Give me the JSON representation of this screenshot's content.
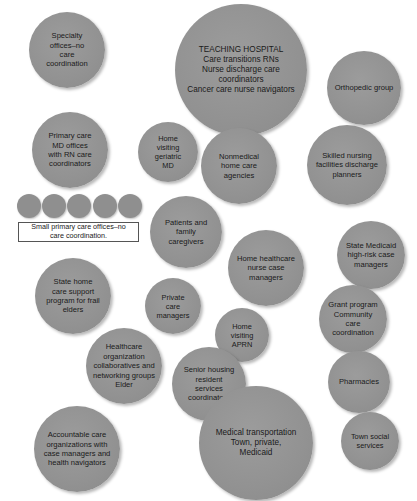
{
  "diagram": {
    "type": "bubble-map",
    "bubbles": [
      {
        "id": "specialty-offices",
        "label": "Specialty\noffices–no\ncare\ncoordination",
        "cx": 67,
        "cy": 50,
        "r": 38
      },
      {
        "id": "teaching-hospital",
        "label": "TEACHING HOSPITAL\nCare transitions RNs\nNurse discharge care\ncoordinators\nCancer care nurse navigators",
        "cx": 241,
        "cy": 70,
        "r": 66
      },
      {
        "id": "orthopedic-group",
        "label": "Orthopedic group",
        "cx": 364,
        "cy": 88,
        "r": 37
      },
      {
        "id": "primary-care-md",
        "label": "Primary care\nMD offices\nwith RN care\ncoordinators",
        "cx": 70,
        "cy": 150,
        "r": 38
      },
      {
        "id": "home-visiting-geriatric-md",
        "label": "Home\nvisiting\ngeriatric\nMD",
        "cx": 168,
        "cy": 152,
        "r": 30
      },
      {
        "id": "nonmedical-home-care",
        "label": "Nonmedical\nhome care\nagencies",
        "cx": 239,
        "cy": 166,
        "r": 38
      },
      {
        "id": "skilled-nursing",
        "label": "Skilled nursing\nfacilities discharge\nplanners",
        "cx": 347,
        "cy": 165,
        "r": 40
      },
      {
        "id": "patients-caregivers",
        "label": "Patients and\nfamily\ncaregivers",
        "cx": 186,
        "cy": 232,
        "r": 36
      },
      {
        "id": "state-medicaid",
        "label": "State Medicaid\nhigh-risk case\nmanagers",
        "cx": 371,
        "cy": 255,
        "r": 34
      },
      {
        "id": "home-healthcare-nurse",
        "label": "Home healthcare\nnurse case\nmanagers",
        "cx": 266,
        "cy": 268,
        "r": 38
      },
      {
        "id": "state-home-care",
        "label": "State home\ncare support\nprogram for frail\nelders",
        "cx": 73,
        "cy": 296,
        "r": 38
      },
      {
        "id": "private-care-managers",
        "label": "Private\ncare\nmanagers",
        "cx": 173,
        "cy": 306,
        "r": 28
      },
      {
        "id": "grant-program",
        "label": "Grant program\nCommunity\ncare\ncoordination",
        "cx": 353,
        "cy": 319,
        "r": 34
      },
      {
        "id": "home-visiting-aprn",
        "label": "Home\nvisiting\nAPRN",
        "cx": 242,
        "cy": 335,
        "r": 27
      },
      {
        "id": "healthcare-org-collaboratives",
        "label": "Healthcare\norganization\ncollaboratives and\nnetworking groups\nElder",
        "cx": 124,
        "cy": 366,
        "r": 38
      },
      {
        "id": "senior-housing",
        "label": "Senior housing\nresident\nservices\ncoordinators",
        "cx": 209,
        "cy": 384,
        "r": 37
      },
      {
        "id": "pharmacies",
        "label": "Pharmacies",
        "cx": 359,
        "cy": 382,
        "r": 31
      },
      {
        "id": "accountable-care",
        "label": "Accountable care\norganizations with\ncase managers and\nhealth navigators",
        "cx": 77,
        "cy": 449,
        "r": 43
      },
      {
        "id": "medical-transportation",
        "label": "Medical transportation\nTown, private,\nMedicaid",
        "cx": 256,
        "cy": 443,
        "r": 57
      },
      {
        "id": "town-social-services",
        "label": "Town social\nservices",
        "cx": 370,
        "cy": 441,
        "r": 29
      }
    ],
    "small_offices": {
      "count": 5,
      "label": "Small primary care offices–no\ncare coordination.",
      "dots": [
        {
          "cx": 29,
          "cy": 206,
          "r": 12
        },
        {
          "cx": 54,
          "cy": 206,
          "r": 12
        },
        {
          "cx": 79,
          "cy": 206,
          "r": 12
        },
        {
          "cx": 105,
          "cy": 206,
          "r": 12
        },
        {
          "cx": 130,
          "cy": 206,
          "r": 12
        }
      ]
    },
    "colors": {
      "bubble_fill": "#929292",
      "text": "#1a1a1a",
      "background": "#ffffff",
      "legend_border": "#555555"
    }
  }
}
